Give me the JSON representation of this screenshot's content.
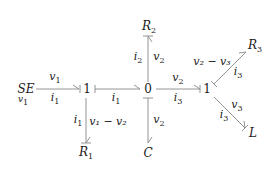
{
  "diagram": {
    "type": "bond-graph",
    "colors": {
      "ink": "#222222",
      "line": "#888888"
    },
    "elements": {
      "source": {
        "name": "SE",
        "sub_label": "v",
        "sub_label_index": "1"
      },
      "junction_left": "1",
      "junction_center": "0",
      "junction_right": "1",
      "r2": {
        "name": "R",
        "index": "2"
      },
      "r1": {
        "name": "R",
        "index": "1"
      },
      "c": {
        "name": "C"
      },
      "r3": {
        "name": "R",
        "index": "3"
      },
      "l": {
        "name": "L"
      }
    },
    "bond_labels": {
      "se_to_1_effort": {
        "sym": "v",
        "idx": "1"
      },
      "se_to_1_flow": {
        "sym": "i",
        "idx": "1"
      },
      "j1_to_0_flow": {
        "sym": "i",
        "idx": "1"
      },
      "j1_to_r1_flow": {
        "sym": "i",
        "idx": "1"
      },
      "j1_to_r1_effort": "v₁ − v₂",
      "j0_to_r2_flow": {
        "sym": "i",
        "idx": "2"
      },
      "j0_to_r2_effort": {
        "sym": "v",
        "idx": "2"
      },
      "j0_to_c_effort": {
        "sym": "v",
        "idx": "2"
      },
      "j0_to_j1_effort": {
        "sym": "v",
        "idx": "2"
      },
      "j0_to_j1_flow": {
        "sym": "i",
        "idx": "3"
      },
      "j1_to_r3_effort": "v₂ − v₃",
      "j1_to_r3_flow": {
        "sym": "i",
        "idx": "3"
      },
      "j1_to_l_effort": {
        "sym": "v",
        "idx": "3"
      },
      "j1_to_l_flow": {
        "sym": "i",
        "idx": "3"
      }
    }
  }
}
